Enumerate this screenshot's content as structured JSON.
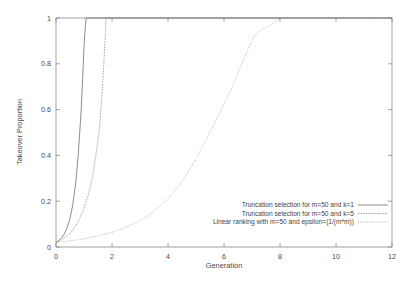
{
  "chart_data": {
    "type": "line",
    "title": "",
    "xlabel": "Generation",
    "ylabel": "Takeover Proportion",
    "xlim": [
      0,
      12
    ],
    "ylim": [
      0,
      1
    ],
    "xticks": [
      "0",
      "2",
      "4",
      "6",
      "8",
      "10",
      "12"
    ],
    "yticks": [
      "0",
      "0.2",
      "0.4",
      "0.6",
      "0.8",
      "1"
    ],
    "grid": false,
    "legend_position": "bottom-right",
    "series": [
      {
        "name": "Truncation selection for m=50 and k=1",
        "style": "solid",
        "points": [
          [
            0.0,
            0.02
          ],
          [
            0.1,
            0.028
          ],
          [
            0.2,
            0.04
          ],
          [
            0.3,
            0.058
          ],
          [
            0.4,
            0.085
          ],
          [
            0.5,
            0.125
          ],
          [
            0.6,
            0.185
          ],
          [
            0.7,
            0.275
          ],
          [
            0.8,
            0.41
          ],
          [
            0.9,
            0.6
          ],
          [
            0.95,
            0.73
          ],
          [
            1.0,
            0.875
          ],
          [
            1.05,
            0.97
          ],
          [
            1.08,
            1.0
          ],
          [
            12.0,
            1.0
          ]
        ]
      },
      {
        "name": "Truncation selection for m=50 and k=5",
        "style": "dashed",
        "points": [
          [
            0.0,
            0.02
          ],
          [
            0.2,
            0.031
          ],
          [
            0.4,
            0.048
          ],
          [
            0.6,
            0.073
          ],
          [
            0.8,
            0.112
          ],
          [
            1.0,
            0.168
          ],
          [
            1.15,
            0.225
          ],
          [
            1.3,
            0.305
          ],
          [
            1.45,
            0.42
          ],
          [
            1.55,
            0.52
          ],
          [
            1.63,
            0.64
          ],
          [
            1.7,
            0.78
          ],
          [
            1.75,
            0.9
          ],
          [
            1.78,
            0.985
          ],
          [
            1.8,
            1.0
          ],
          [
            12.0,
            1.0
          ]
        ]
      },
      {
        "name": "Linear ranking with m=50 and epsilon=(1/(m*m))",
        "style": "dotted",
        "points": [
          [
            0.0,
            0.02
          ],
          [
            0.5,
            0.027
          ],
          [
            1.0,
            0.036
          ],
          [
            1.5,
            0.048
          ],
          [
            2.0,
            0.064
          ],
          [
            2.5,
            0.086
          ],
          [
            3.0,
            0.115
          ],
          [
            3.5,
            0.155
          ],
          [
            4.0,
            0.21
          ],
          [
            4.5,
            0.285
          ],
          [
            5.0,
            0.385
          ],
          [
            5.3,
            0.455
          ],
          [
            5.6,
            0.525
          ],
          [
            6.0,
            0.625
          ],
          [
            6.3,
            0.7
          ],
          [
            6.6,
            0.79
          ],
          [
            6.9,
            0.875
          ],
          [
            7.1,
            0.925
          ],
          [
            7.3,
            0.945
          ],
          [
            7.6,
            0.965
          ],
          [
            7.9,
            0.99
          ],
          [
            8.05,
            1.0
          ],
          [
            12.0,
            1.0
          ]
        ]
      }
    ]
  },
  "legend": {
    "entries": [
      {
        "label": "Truncation selection for m=50 and k=1",
        "sample": "solid-line-sample"
      },
      {
        "label": "Truncation selection for m=50 and k=5",
        "sample": "dashed-line-sample"
      },
      {
        "label": "Linear ranking with m=50 and epsilon=(1/(m*m))",
        "sample": "dotted-line-sample"
      }
    ]
  },
  "colors": {
    "axis": "#8a8a8a",
    "text": "#4a4a4a",
    "series_1": "#6f6f6f",
    "series_2": "#8d8d8d",
    "series_3": "#9a9a9a",
    "background": "#ffffff"
  }
}
